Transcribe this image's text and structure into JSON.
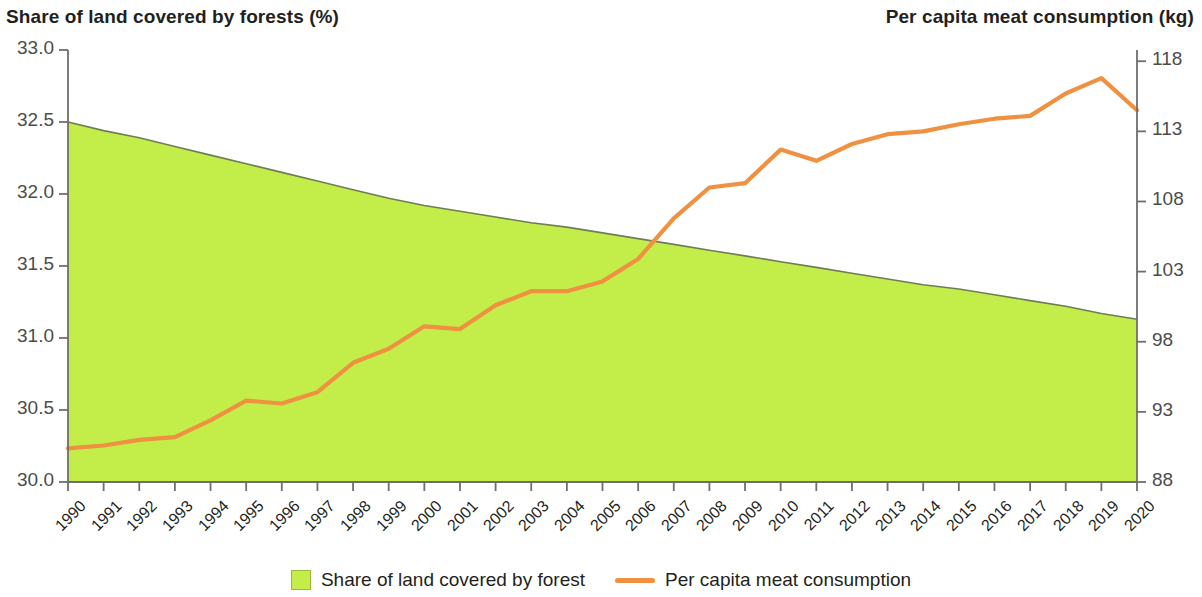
{
  "left_axis": {
    "title": "Share of land covered by forests (%)",
    "ticks": [
      "30.0",
      "30.5",
      "31.0",
      "31.5",
      "32.0",
      "32.5",
      "33.0"
    ]
  },
  "right_axis": {
    "title": "Per capita meat consumption (kg)",
    "ticks": [
      "88",
      "93",
      "98",
      "103",
      "108",
      "113",
      "118"
    ]
  },
  "legend": {
    "items": [
      {
        "label": "Share of land covered by forest",
        "marker": "area-swatch",
        "color": "#c3ee4a"
      },
      {
        "label": "Per capita meat consumption",
        "marker": "line-swatch",
        "color": "#ef9140"
      }
    ]
  },
  "colors": {
    "forest_fill": "#c3ee4a",
    "forest_stroke": "#6f7d55",
    "meat_line": "#ef9140",
    "axis": "#6e6e6e",
    "text": "#231f20",
    "tick_text": "#4c4c4c",
    "background": "#ffffff"
  },
  "chart_data": {
    "type": "area",
    "title": "",
    "xlabel": "",
    "grid": false,
    "legend_position": "bottom",
    "x": [
      1990,
      1991,
      1992,
      1993,
      1994,
      1995,
      1996,
      1997,
      1998,
      1999,
      2000,
      2001,
      2002,
      2003,
      2004,
      2005,
      2006,
      2007,
      2008,
      2009,
      2010,
      2011,
      2012,
      2013,
      2014,
      2015,
      2016,
      2017,
      2018,
      2019,
      2020
    ],
    "categories": [
      "1990",
      "1991",
      "1992",
      "1993",
      "1994",
      "1995",
      "1996",
      "1997",
      "1998",
      "1999",
      "2000",
      "2001",
      "2002",
      "2003",
      "2004",
      "2005",
      "2006",
      "2007",
      "2008",
      "2009",
      "2010",
      "2011",
      "2012",
      "2013",
      "2014",
      "2015",
      "2016",
      "2017",
      "2018",
      "2019",
      "2020"
    ],
    "series": [
      {
        "name": "Share of land covered by forest",
        "type": "area",
        "axis": "left",
        "ylabel": "Share of land covered by forests (%)",
        "ylim": [
          30.0,
          33.0
        ],
        "color": "#c3ee4a",
        "values": [
          32.5,
          32.44,
          32.39,
          32.33,
          32.27,
          32.21,
          32.15,
          32.09,
          32.03,
          31.97,
          31.92,
          31.88,
          31.84,
          31.8,
          31.77,
          31.73,
          31.69,
          31.65,
          31.61,
          31.57,
          31.53,
          31.49,
          31.45,
          31.41,
          31.37,
          31.34,
          31.3,
          31.26,
          31.22,
          31.17,
          31.13
        ]
      },
      {
        "name": "Per capita meat consumption",
        "type": "line",
        "axis": "right",
        "ylabel": "Per capita meat consumption (kg)",
        "ylim": [
          88,
          118.8
        ],
        "color": "#ef9140",
        "values": [
          90.4,
          90.6,
          91.0,
          91.2,
          92.4,
          93.8,
          93.6,
          94.4,
          96.5,
          97.5,
          99.1,
          98.9,
          100.6,
          101.6,
          101.6,
          102.3,
          103.9,
          106.8,
          109.0,
          109.3,
          111.7,
          110.9,
          112.1,
          112.8,
          113.0,
          113.5,
          113.9,
          114.1,
          115.7,
          116.8,
          114.5
        ]
      }
    ]
  }
}
